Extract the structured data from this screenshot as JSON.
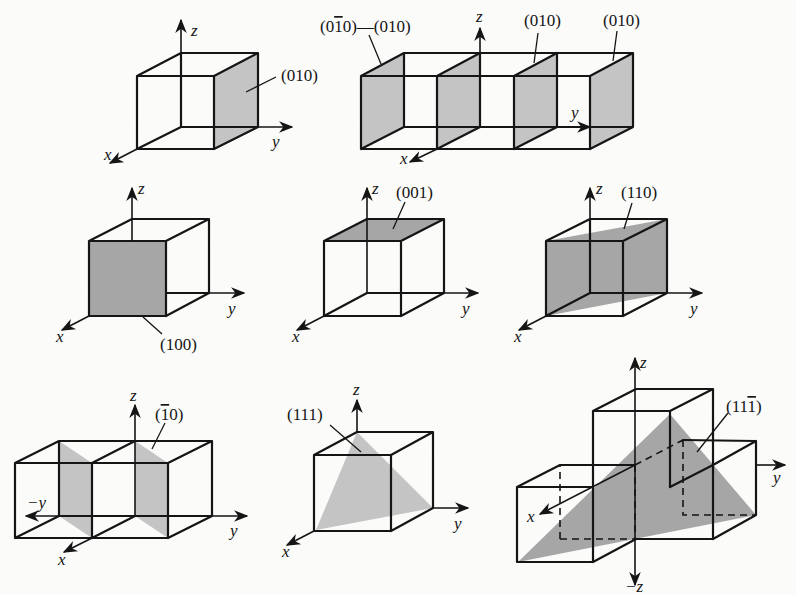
{
  "figure": {
    "colors": {
      "plane_fill": "#c4c4c4",
      "plane_fill_dark": "#a6a6a6",
      "line": "#151515",
      "background": "#fbfbfa"
    },
    "axes": {
      "x": "x",
      "y": "y",
      "z": "z",
      "neg_y": "−y",
      "neg_z": "−z"
    },
    "panels": [
      {
        "id": "a",
        "plane": "(010)",
        "labels": [
          "(010)"
        ]
      },
      {
        "id": "b",
        "plane": "(010) family",
        "labels": [
          "(0̅0̅ )",
          "(010)",
          "(010)",
          "(010)"
        ],
        "label_parts": {
          "first_a": "(0",
          "first_bar": "1",
          "first_b": "0)—(010)"
        }
      },
      {
        "id": "c",
        "plane": "(100)",
        "labels": [
          "(100)"
        ]
      },
      {
        "id": "d",
        "plane": "(001)",
        "labels": [
          "(001)"
        ]
      },
      {
        "id": "e",
        "plane": "(110)",
        "labels": [
          "(110)"
        ]
      },
      {
        "id": "f",
        "plane": "(1̅0)",
        "labels": [
          "(1̅0)"
        ],
        "label_parts": {
          "a": "(",
          "bar": "1",
          "b": "0)"
        }
      },
      {
        "id": "g",
        "plane": "(111)",
        "labels": [
          "(111)"
        ]
      },
      {
        "id": "h",
        "plane": "(111̅)",
        "labels": [
          "(111̅)"
        ],
        "label_parts": {
          "a": "(11",
          "bar": "1",
          "b": ")"
        }
      }
    ]
  }
}
